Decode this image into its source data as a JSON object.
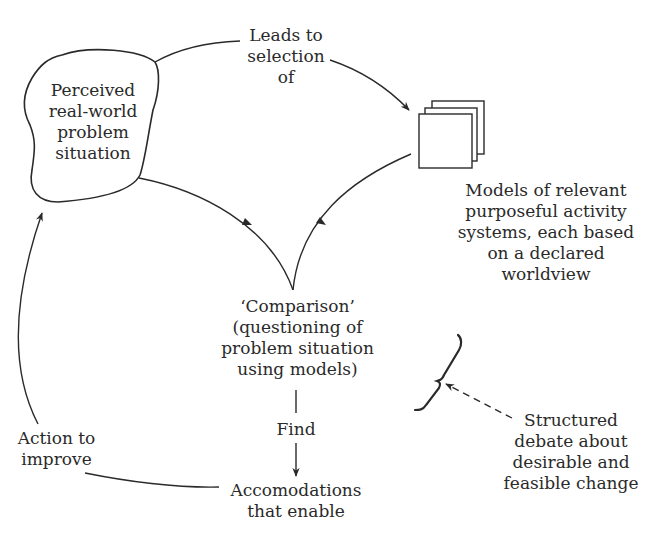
{
  "diagram": {
    "type": "soft-systems-methodology-cycle",
    "nodes": {
      "problem_situation": {
        "label": "Perceived\nreal-world\nproblem\nsituation"
      },
      "models": {
        "label": "Models of relevant\npurposeful activity\nsystems, each based\non a declared\nworldview"
      },
      "comparison": {
        "label": "‘Comparison’\n(questioning of\nproblem situation\nusing models)"
      },
      "accommodations": {
        "label": "Accomodations\nthat enable"
      },
      "debate": {
        "label": "Structured\ndebate about\ndesirable and\nfeasible change"
      }
    },
    "edges": {
      "leads_to": {
        "label": "Leads to\nselection\nof"
      },
      "find": {
        "label": "Find"
      },
      "action": {
        "label": "Action to\nimprove"
      }
    },
    "colors": {
      "stroke": "#2a2a2a",
      "text": "#2a2a2a",
      "background": "#ffffff"
    }
  }
}
